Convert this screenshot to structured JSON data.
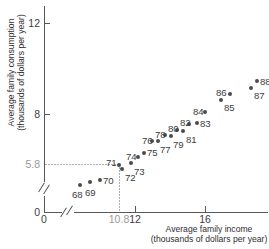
{
  "chart_data": {
    "type": "scatter",
    "title": "",
    "xlabel": "Average family income\n(thousands of dollars per year)",
    "ylabel": "Average family consumption\n(thousands of dollars per year)",
    "xlim": [
      9.0,
      18.4
    ],
    "ylim": [
      4.6,
      12.6
    ],
    "grid": false,
    "legend": null,
    "axis_break_x": true,
    "axis_break_y": true,
    "xticks": [
      {
        "label": "0",
        "value": 0,
        "px": 44
      },
      {
        "label": "10.8",
        "value": 10.8,
        "px": 119,
        "gray": true
      },
      {
        "label": "12",
        "value": 12,
        "px": 135
      },
      {
        "label": "16",
        "value": 16,
        "px": 205
      }
    ],
    "yticks": [
      {
        "label": "12",
        "value": 12,
        "px": 23
      },
      {
        "label": "8",
        "value": 8,
        "px": 114
      },
      {
        "label": "5.8",
        "value": 5.8,
        "px": 164,
        "gray": true
      },
      {
        "label": "0",
        "value": 0,
        "px": 212
      }
    ],
    "highlight": {
      "x": 10.8,
      "y": 5.8,
      "label": "71"
    },
    "points": [
      {
        "label": "68",
        "x": 11.05,
        "y": 4.8,
        "px": 80,
        "py": 185,
        "lx": 72,
        "ly": 190
      },
      {
        "label": "69",
        "x": 11.6,
        "y": 4.93,
        "px": 90,
        "py": 182,
        "lx": 85,
        "ly": 188
      },
      {
        "label": "70",
        "x": 12.2,
        "y": 5.03,
        "px": 100,
        "py": 180,
        "lx": 103,
        "ly": 176
      },
      {
        "label": "71",
        "x": 10.8,
        "y": 5.8,
        "px": 119,
        "py": 165,
        "lx": 106,
        "ly": 158
      },
      {
        "label": "72",
        "x": 13.45,
        "y": 5.62,
        "px": 122,
        "py": 169,
        "lx": 125,
        "ly": 173
      },
      {
        "label": "73",
        "x": 13.95,
        "y": 5.92,
        "px": 131,
        "py": 163,
        "lx": 134,
        "ly": 167
      },
      {
        "label": "74",
        "x": 14.35,
        "y": 6.16,
        "px": 138,
        "py": 157,
        "lx": 126,
        "ly": 152
      },
      {
        "label": "75",
        "x": 14.7,
        "y": 6.34,
        "px": 144,
        "py": 153,
        "lx": 147,
        "ly": 148
      },
      {
        "label": "76",
        "x": 15.15,
        "y": 6.6,
        "px": 152,
        "py": 141,
        "lx": 142,
        "ly": 136
      },
      {
        "label": "77",
        "x": 15.55,
        "y": 6.64,
        "px": 158,
        "py": 141,
        "lx": 160,
        "ly": 145
      },
      {
        "label": "78",
        "x": 15.9,
        "y": 6.85,
        "px": 165,
        "py": 135,
        "lx": 155,
        "ly": 130
      },
      {
        "label": "79",
        "x": 16.25,
        "y": 6.82,
        "px": 171,
        "py": 136,
        "lx": 173,
        "ly": 140
      },
      {
        "label": "80",
        "x": 16.6,
        "y": 7.12,
        "px": 177,
        "py": 130,
        "lx": 168,
        "ly": 124
      },
      {
        "label": "81",
        "x": 16.95,
        "y": 7.05,
        "px": 183,
        "py": 131,
        "lx": 186,
        "ly": 135
      },
      {
        "label": "82",
        "x": 17.25,
        "y": 7.42,
        "px": 189,
        "py": 124,
        "lx": 180,
        "ly": 118
      },
      {
        "label": "83",
        "x": 17.7,
        "y": 7.45,
        "px": 197,
        "py": 123,
        "lx": 200,
        "ly": 119
      },
      {
        "label": "84",
        "x": 18.05,
        "y": 7.95,
        "px": 205,
        "py": 112,
        "lx": 193,
        "ly": 107
      },
      {
        "label": "85",
        "x": 18.45,
        "y": 8.45,
        "px": 221,
        "py": 100,
        "lx": 224,
        "ly": 103
      },
      {
        "label": "86",
        "x": 18.75,
        "y": 8.7,
        "px": 230,
        "py": 94,
        "lx": 216,
        "ly": 88
      },
      {
        "label": "87",
        "x": 19.05,
        "y": 8.9,
        "px": 251,
        "py": 88,
        "lx": 254,
        "ly": 91
      },
      {
        "label": "88",
        "x": 19.35,
        "y": 9.2,
        "px": 257,
        "py": 81,
        "lx": 260,
        "ly": 77
      }
    ]
  }
}
